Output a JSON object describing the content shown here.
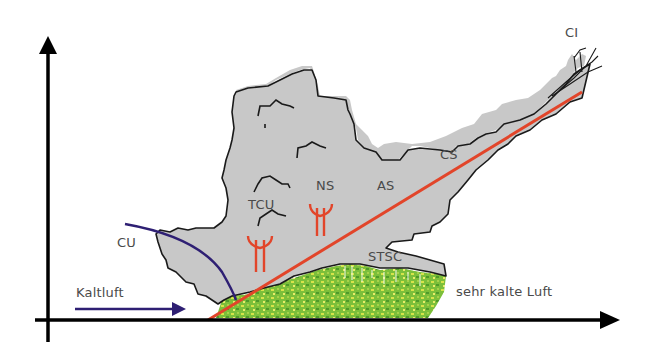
{
  "diagram": {
    "labels": {
      "ci": "CI",
      "cs": "CS",
      "as": "AS",
      "ns": "NS",
      "tcu": "TCU",
      "cu": "CU",
      "stsc": "STSC",
      "cold_air": "Kaltluft",
      "very_cold_air": "sehr kalte Luft"
    },
    "colors": {
      "cloud_fill": "#c8c8c8",
      "cloud_outline": "#1a1a1a",
      "front_line": "#e2452a",
      "cold_front_curve": "#2e1f73",
      "arrow_cold_air": "#2e1f73",
      "precip_symbol": "#e2452a",
      "vegetation": "#6bb22e",
      "axis": "#000000",
      "label_text": "#4a4a4a"
    },
    "axes": {
      "x_axis": "horizontal arrow to right",
      "y_axis": "vertical arrow upward"
    }
  }
}
